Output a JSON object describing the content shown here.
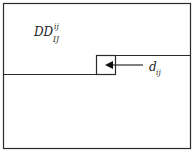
{
  "diagram": {
    "region_label": {
      "base": "DD",
      "superscript": "ij",
      "subscript": "IJ"
    },
    "arrow_label": {
      "base": "d",
      "subscript": "ij"
    },
    "colors": {
      "stroke": "#2a2a2a",
      "background": "#ffffff"
    }
  }
}
